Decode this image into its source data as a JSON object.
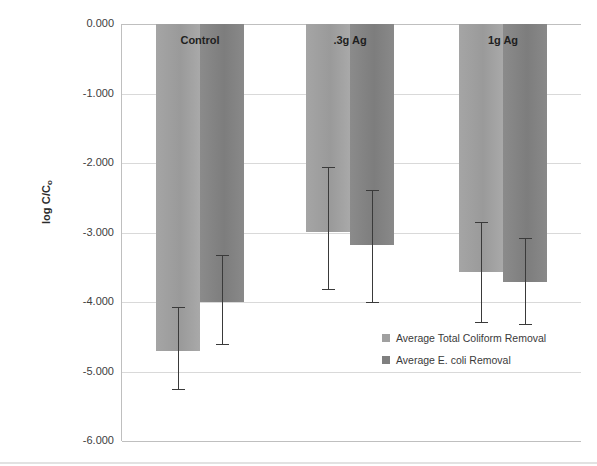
{
  "chart_data": {
    "type": "bar",
    "title": "",
    "xlabel": "",
    "ylabel": "log C/C₀",
    "ylabel_main": "log C/C",
    "ylabel_sub": "o",
    "ylim": [
      -6.0,
      0.0
    ],
    "ytick_labels": [
      "0.000",
      "-1.000",
      "-2.000",
      "-3.000",
      "-4.000",
      "-5.000",
      "-6.000"
    ],
    "ytick_values": [
      0.0,
      -1.0,
      -2.0,
      -3.0,
      -4.0,
      -5.0,
      -6.0
    ],
    "grid": true,
    "legend_position": "inside-lower-right",
    "categories": [
      "Control",
      ".3g Ag",
      "1g Ag"
    ],
    "series": [
      {
        "name": "Average Total Coliform Removal",
        "color": "#a0a0a0",
        "values": [
          -4.71,
          -2.99,
          -3.57
        ],
        "err_low": [
          -5.27,
          -3.83,
          -4.3
        ],
        "err_high": [
          -4.07,
          -2.06,
          -2.85
        ]
      },
      {
        "name": "Average E. coli Removal",
        "color": "#7f7f7f",
        "values": [
          -4.0,
          -3.18,
          -3.71
        ],
        "err_low": [
          -4.62,
          -4.01,
          -4.33
        ],
        "err_high": [
          -3.32,
          -2.39,
          -3.08
        ]
      }
    ]
  },
  "legend": {
    "items": [
      {
        "label": "Average Total Coliform Removal"
      },
      {
        "label": "Average E. coli Removal"
      }
    ]
  },
  "group_labels": [
    "Control",
    ".3g Ag",
    "1g Ag"
  ],
  "colors": {
    "series_total": "#a0a0a0",
    "series_ecoli": "#7f7f7f",
    "gridline": "#d9d9d9",
    "axis": "#bfbfbf",
    "error_bar": "#3a3a3a",
    "text": "#404040"
  }
}
